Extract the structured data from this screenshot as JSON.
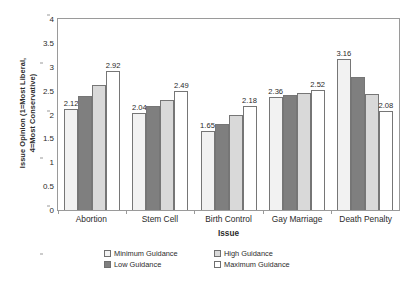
{
  "chart_data": {
    "type": "bar",
    "title": "",
    "xlabel": "Issue",
    "ylabel": "Issue Opinion (1=Most Liberal, 4=Most Conservative)",
    "ylabel_line1": "Issue Opinion (1=Most Liberal,",
    "ylabel_line2": "4=Most Conservative)",
    "categories": [
      "Abortion",
      "Stem Cell",
      "Birth Control",
      "Gay Marriage",
      "Death Penalty"
    ],
    "series": [
      {
        "name": "Minimum Guidance",
        "values": [
          2.12,
          2.04,
          1.65,
          2.36,
          3.16
        ],
        "labels": [
          "2.12",
          "2.04",
          "1.65",
          "2.36",
          "3.16"
        ],
        "show_labels": [
          true,
          true,
          true,
          true,
          true
        ]
      },
      {
        "name": "Low Guidance",
        "values": [
          2.38,
          2.17,
          1.8,
          2.41,
          2.78
        ],
        "labels": [
          "",
          "",
          "",
          "",
          ""
        ],
        "show_labels": [
          false,
          false,
          false,
          false,
          false
        ]
      },
      {
        "name": "High Guidance",
        "values": [
          2.62,
          2.31,
          1.99,
          2.45,
          2.42
        ],
        "labels": [
          "",
          "",
          "",
          "",
          ""
        ],
        "show_labels": [
          false,
          false,
          false,
          false,
          false
        ]
      },
      {
        "name": "Maximum Guidance",
        "values": [
          2.92,
          2.49,
          2.18,
          2.52,
          2.08
        ],
        "labels": [
          "2.92",
          "2.49",
          "2.18",
          "2.52",
          "2.08"
        ],
        "show_labels": [
          true,
          true,
          true,
          true,
          true
        ]
      }
    ],
    "ylim": [
      0,
      4
    ],
    "yticks": [
      0,
      0.5,
      1,
      1.5,
      2,
      2.5,
      3,
      3.5,
      4
    ],
    "ytick_labels": [
      "0",
      "0.5",
      "1",
      "1.5",
      "2",
      "2.5",
      "3",
      "3.5",
      "4"
    ],
    "grid": false,
    "legend_position": "bottom",
    "legend_entries": [
      {
        "label": "Minimum Guidance",
        "swatch": "light-dotted",
        "color": "#f2f2f2"
      },
      {
        "label": "High Guidance",
        "swatch": "light-gray",
        "color": "#d9d9d9"
      },
      {
        "label": "Low Guidance",
        "swatch": "dark-gray",
        "color": "#7f7f7f"
      },
      {
        "label": "Maximum Guidance",
        "swatch": "white",
        "color": "#ffffff"
      }
    ]
  }
}
